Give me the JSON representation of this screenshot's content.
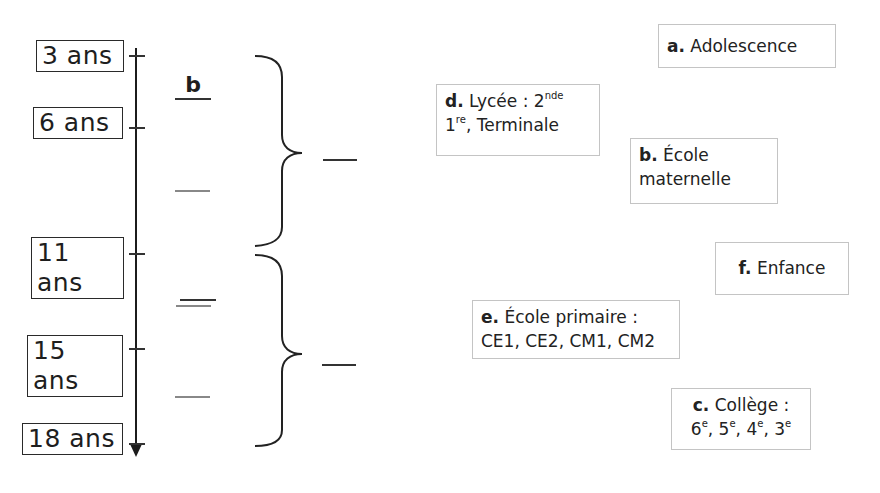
{
  "timeline": {
    "ages": [
      {
        "label": "3 ans"
      },
      {
        "label": "6 ans"
      },
      {
        "label": "11 ans"
      },
      {
        "label": "15 ans"
      },
      {
        "label": "18 ans"
      }
    ],
    "example_answer": "b"
  },
  "labels": {
    "a": {
      "letter": "a.",
      "text": "Adolescence"
    },
    "b": {
      "letter": "b.",
      "line1": "École",
      "line2": "maternelle"
    },
    "c": {
      "letter": "c.",
      "line1": "Collège :",
      "grades": [
        {
          "num": "6",
          "sup": "e"
        },
        {
          "num": "5",
          "sup": "e"
        },
        {
          "num": "4",
          "sup": "e"
        },
        {
          "num": "3",
          "sup": "e"
        }
      ]
    },
    "d": {
      "letter": "d.",
      "line1": "Lycée : 2",
      "line1_sup": "nde",
      "line2_num": "1",
      "line2_sup": "re",
      "line2_rest": ", Terminale"
    },
    "e": {
      "letter": "e.",
      "line1": "École primaire :",
      "line2": "CE1, CE2, CM1, CM2"
    },
    "f": {
      "letter": "f.",
      "text": "Enfance"
    }
  },
  "separator": ", "
}
